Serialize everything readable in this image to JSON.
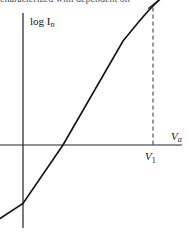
{
  "header_fragment": "characterized with dependent on",
  "chart_data": {
    "type": "line",
    "title": "",
    "ylabel": "log I",
    "ylabel_subscript": "n",
    "xlabel": "V",
    "xlabel_subscript": "a",
    "marked_point_label": "V",
    "marked_point_subscript": "1",
    "series": [
      {
        "name": "log In vs Va",
        "description": "linear rise then saturating plateau",
        "x": [
          -0.6,
          0.0,
          0.4,
          1.0,
          1.3,
          1.5,
          1.7,
          1.9
        ],
        "y": [
          -0.75,
          -0.45,
          0.0,
          0.8,
          1.08,
          1.2,
          1.24,
          1.25
        ]
      }
    ],
    "markers": [
      {
        "type": "vertical-dashed",
        "x": 1.3,
        "label": "V1"
      },
      {
        "type": "tick",
        "x": 1.3,
        "y": 1.08
      }
    ],
    "xlim": [
      -0.25,
      1.9
    ],
    "ylim": [
      -0.9,
      1.45
    ],
    "grid": false
  }
}
